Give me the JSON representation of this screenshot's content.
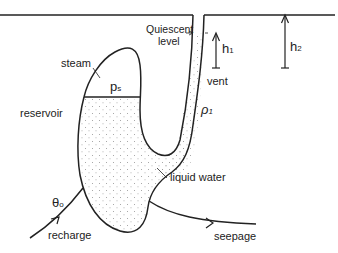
{
  "diagram": {
    "labels": {
      "quiescent_line1": "Quiescent",
      "quiescent_line2": "level",
      "h1": "h",
      "h1_sub": "1",
      "h2": "h",
      "h2_sub": "2",
      "steam": "steam",
      "ps": "p",
      "ps_sub": "s",
      "reservoir": "reservoir",
      "vent": "vent",
      "rho1": "ρ",
      "rho1_sub": "1",
      "liquid_water": "liquid water",
      "theta0": "θ",
      "theta0_sub": "o",
      "recharge": "recharge",
      "seepage": "seepage"
    },
    "colors": {
      "stroke": "#222222",
      "stipple": "#9a9a9a",
      "background": "#ffffff"
    }
  }
}
